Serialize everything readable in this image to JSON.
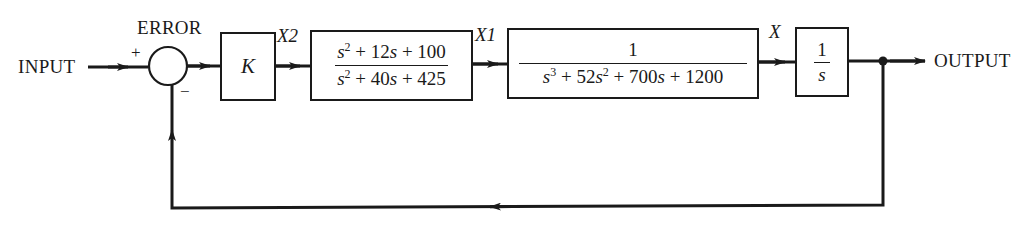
{
  "diagram": {
    "type": "feedback-control-block-diagram",
    "colors": {
      "line": "#1a1a1a",
      "background": "#ffffff"
    },
    "labels": {
      "input": "INPUT",
      "output": "OUTPUT",
      "error": "ERROR",
      "plus_sign": "+",
      "minus_sign": "−",
      "x2": "X2",
      "x1": "X1",
      "x": "X"
    },
    "blocks": {
      "gain": {
        "label": "K"
      },
      "compensator": {
        "numerator": {
          "t1": "s",
          "e1": "2",
          "rest": " + 12",
          "t2": "s",
          "tail": " + 100"
        },
        "denominator": {
          "t1": "s",
          "e1": "2",
          "rest": " + 40",
          "t2": "s",
          "tail": " + 425"
        }
      },
      "plant": {
        "numerator": "1",
        "denominator": {
          "t1": "s",
          "e1": "3",
          "p1": " + 52",
          "t2": "s",
          "e2": "2",
          "p2": " + 700",
          "t3": "s",
          "tail": " + 1200"
        }
      },
      "integrator": {
        "numerator": "1",
        "denominator": "s"
      }
    },
    "nodes": {
      "summing_junction": {
        "inputs": [
          "+",
          "−"
        ]
      },
      "pickoff_point": "output branch to unity feedback"
    }
  }
}
